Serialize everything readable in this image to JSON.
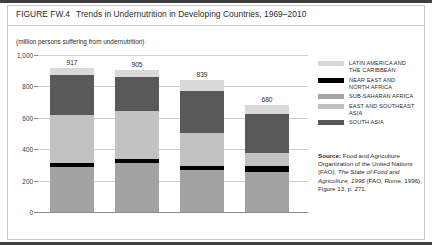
{
  "figure": {
    "number": "FIGURE FW.4",
    "title": "Trends in Undernutrition in Developing Countries, 1969–2010",
    "units_caption": "(million persons suffering from undernutrition)"
  },
  "source": {
    "label": "Source:",
    "part1": " Food and Agriculture Organization of the United Nations (FAO), ",
    "italic1": "The State of Food and Agriculture, 1996",
    "part2": " (FAO, Rome, 1996), Figure 13, p. 271."
  },
  "colors": {
    "latin_america": "#d9d9d9",
    "near_east": "#000000",
    "sub_saharan": "#a3a3a3",
    "east_southeast_asia": "#c2c2c2",
    "south_asia": "#595959",
    "gridline": "#cfcfcf",
    "axis": "#8a8a8a",
    "frame": "#3f3f3f",
    "text": "#2b2b2b"
  },
  "chart_data": {
    "type": "bar",
    "title": "Trends in Undernutrition in Developing Countries, 1969–2010",
    "subtitle": "(million persons suffering from undernutrition)",
    "xlabel": "",
    "ylabel": "million persons suffering from undernutrition",
    "stacked": true,
    "grid": true,
    "legend_position": "right",
    "ylim": [
      0,
      1000
    ],
    "yticks": [
      0,
      200,
      400,
      600,
      800,
      1000
    ],
    "ytick_labels": [
      "0",
      "200",
      "400",
      "600",
      "800",
      "1,000"
    ],
    "categories": [
      "1969-71",
      "1979-81",
      "1990-92",
      "2010"
    ],
    "totals": [
      917,
      905,
      839,
      680
    ],
    "series": [
      {
        "name": "SOUTH ASIA",
        "color": "#a3a3a3",
        "values": [
          285,
          310,
          265,
          255
        ]
      },
      {
        "name": "NEAR EAST AND NORTH AFRICA",
        "color": "#000000",
        "values": [
          30,
          27,
          25,
          38
        ]
      },
      {
        "name": "SUB-SAHARAN AFRICA",
        "color": "#c2c2c2",
        "values": [
          305,
          308,
          215,
          85
        ]
      },
      {
        "name": "EAST AND SOUTHEAST ASIA",
        "color": "#595959",
        "values": [
          252,
          215,
          269,
          247
        ]
      },
      {
        "name": "LATIN AMERICA AND THE CARIBBEAN",
        "color": "#d9d9d9",
        "values": [
          45,
          45,
          65,
          55
        ]
      }
    ],
    "legend_entries": [
      {
        "label_line1": "LATIN AMERICA AND",
        "label_line2": "THE CARIBBEAN",
        "color": "#d9d9d9"
      },
      {
        "label_line1": "NEAR EAST AND",
        "label_line2": "NORTH AFRICA",
        "color": "#000000"
      },
      {
        "label_line1": "SUB-SAHARAN AFRICA",
        "label_line2": "",
        "color": "#a3a3a3"
      },
      {
        "label_line1": "EAST AND SOUTHEAST ASIA",
        "label_line2": "",
        "color": "#c2c2c2"
      },
      {
        "label_line1": "SOUTH ASIA",
        "label_line2": "",
        "color": "#595959"
      }
    ]
  }
}
